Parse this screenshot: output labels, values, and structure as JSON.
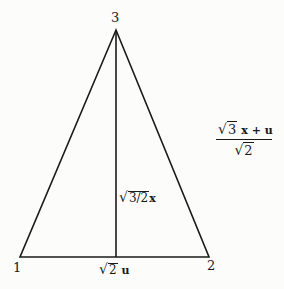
{
  "diagram": {
    "type": "isosceles triangle with altitude",
    "vertices": [
      {
        "id": "1",
        "label": "1",
        "x": 20,
        "y": 257
      },
      {
        "id": "2",
        "label": "2",
        "x": 209,
        "y": 257
      },
      {
        "id": "3",
        "label": "3",
        "x": 116,
        "y": 30
      }
    ],
    "edges": [
      {
        "from": "1",
        "to": "2"
      },
      {
        "from": "2",
        "to": "3"
      },
      {
        "from": "3",
        "to": "1"
      },
      {
        "from": "3",
        "to": "base-midpoint",
        "style": "altitude"
      }
    ],
    "labels": {
      "vertex_1": "1",
      "vertex_2": "2",
      "vertex_3": "3",
      "altitude_radical": "3/2",
      "altitude_var": "x",
      "base_radical": "2",
      "base_var": "u",
      "fraction_num_radical": "3",
      "fraction_num_rest": "x + u",
      "fraction_den_radical": "2"
    },
    "stroke_color": "#1a1a1a",
    "background": "#fcfcfa"
  }
}
